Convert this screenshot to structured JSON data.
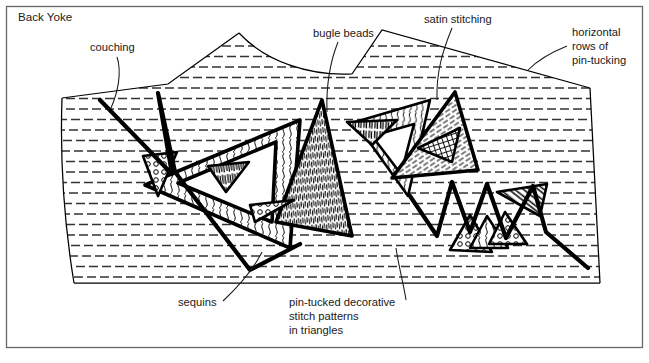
{
  "figure": {
    "title": "Back Yoke",
    "border_color": "#555555",
    "ink_color": "#000000",
    "tuck_color": "#2b2b2b",
    "background": "#ffffff"
  },
  "labels": [
    {
      "id": "back-yoke",
      "text": "Back Yoke",
      "lines": [
        "Back Yoke"
      ],
      "x": 18,
      "y": 21,
      "anchor": "start",
      "has_leader": false
    },
    {
      "id": "couching",
      "text": "couching",
      "lines": [
        "couching"
      ],
      "x": 90,
      "y": 51,
      "anchor": "start",
      "has_leader": true
    },
    {
      "id": "bugle-beads",
      "text": "bugle beads",
      "lines": [
        "bugle beads"
      ],
      "x": 313,
      "y": 37,
      "anchor": "start",
      "has_leader": true
    },
    {
      "id": "satin-stitching",
      "text": "satin stitching",
      "lines": [
        "satin stitching"
      ],
      "x": 424,
      "y": 23,
      "anchor": "start",
      "has_leader": true
    },
    {
      "id": "horizontal-rows-of-pin-tucking",
      "text": "horizontal rows of pin-tucking",
      "lines": [
        "horizontal",
        "rows of",
        "pin-tucking"
      ],
      "x": 572,
      "y": 36,
      "anchor": "start",
      "has_leader": true
    },
    {
      "id": "sequins",
      "text": "sequins",
      "lines": [
        "sequins"
      ],
      "x": 178,
      "y": 306,
      "anchor": "start",
      "has_leader": true
    },
    {
      "id": "pin-tucked-decorative-stitch-patterns-in-triangles",
      "text": "pin-tucked decorative stitch patterns in triangles",
      "lines": [
        "pin-tucked decorative",
        "stitch patterns",
        "in triangles"
      ],
      "x": 289,
      "y": 306,
      "anchor": "start",
      "has_leader": true
    }
  ],
  "leaders": [
    {
      "id": "leader-couching",
      "d": "M 117 57 C 122 72, 118 92, 111 108"
    },
    {
      "id": "leader-bugle-beads",
      "d": "M 338 42 C 330 62, 326 82, 327 112"
    },
    {
      "id": "leader-satin-stitching",
      "d": "M 452 28 C 443 50, 436 72, 437 100"
    },
    {
      "id": "leader-pin-tucking",
      "d": "M 567 46 C 552 52, 538 60, 528 70"
    },
    {
      "id": "leader-sequins",
      "d": "M 223 301 C 237 288, 252 272, 262 252"
    },
    {
      "id": "leader-stitch-patterns",
      "d": "M 406 300 C 404 286, 399 268, 396 248"
    }
  ],
  "yoke_outline": {
    "id": "yoke-panel",
    "d": "M 62 98 L 168 84 L 239 33 C 266 62, 310 76, 352 74 L 382 30 L 590 88 L 600 283 L 74 283 C 64 222, 60 156, 62 98 Z"
  },
  "garment_seams": [
    {
      "id": "shoulder-seam-left",
      "d": "M 62 98 L 168 84 L 239 33"
    },
    {
      "id": "neckline-curve",
      "d": "M 239 33 C 266 62, 310 76, 352 74"
    },
    {
      "id": "shoulder-seam-right",
      "d": "M 352 74 L 382 30 L 590 88"
    },
    {
      "id": "side-seam-right",
      "d": "M 590 88 L 600 283"
    },
    {
      "id": "hem-edge",
      "d": "M 600 283 L 74 283"
    },
    {
      "id": "side-seam-left",
      "d": "M 74 283 C 64 222, 60 156, 62 98"
    }
  ],
  "pin_tucking": {
    "name": "horizontal-rows-of-pin-tucking",
    "row_spacing_px": 10.5,
    "dash_pattern": "9 4",
    "stroke_width": 1.6,
    "rows": 24,
    "first_row_y": 46,
    "color": "#333333"
  },
  "decorative_elements": [
    {
      "id": "couching-line",
      "kind": "couching",
      "note": "heavy free-form couched cord running across the yoke"
    },
    {
      "id": "bugle-beads",
      "kind": "bugle-beads",
      "note": "short stroke clusters inside small triangles"
    },
    {
      "id": "satin-stitch",
      "kind": "satin-stitching",
      "note": "dense parallel fill in triangles"
    },
    {
      "id": "sequins",
      "kind": "sequins",
      "note": "small circles scattered in triangle wedges"
    },
    {
      "id": "triangle-stitch",
      "kind": "stitch-patterns",
      "note": "wavy, vertical, hatched machine-stitch fills"
    }
  ],
  "triangles": [
    {
      "id": "tri-big-left",
      "fill": "wavy",
      "points": "145,185 300,120 290,248"
    },
    {
      "id": "tri-big-left-in",
      "fill": "none",
      "points": "178,183 276,142 272,222"
    },
    {
      "id": "tri-vertical",
      "fill": "vertical",
      "points": "322,100 352,236 276,222"
    },
    {
      "id": "tri-wave-mid",
      "fill": "wavy2",
      "points": "355,122 430,100 408,196"
    },
    {
      "id": "tri-wave-mid-in",
      "fill": "none",
      "points": "372,136 414,124 401,174"
    },
    {
      "id": "tri-big-right",
      "fill": "diagonal",
      "points": "392,178 455,92 478,170"
    },
    {
      "id": "tri-right-inner",
      "fill": "grid",
      "points": "418,148 460,128 452,162"
    },
    {
      "id": "tri-bead-small",
      "fill": "bead",
      "points": "347,122 397,120 372,145"
    },
    {
      "id": "tri-seq-left",
      "fill": "sequin",
      "points": "143,156 177,152 158,196"
    },
    {
      "id": "tri-fan-left",
      "fill": "fan",
      "points": "208,166 249,162 226,192"
    },
    {
      "id": "tri-seq-mid",
      "fill": "sequin",
      "points": "250,205 294,200 255,222"
    },
    {
      "id": "tri-hatch-right",
      "fill": "hatch",
      "points": "497,192 547,184 540,216"
    },
    {
      "id": "tri-lr-a",
      "fill": "sequin",
      "points": "450,250 470,215 492,252"
    },
    {
      "id": "tri-lr-b",
      "fill": "wavy",
      "points": "470,248 487,216 508,248"
    },
    {
      "id": "tri-lr-c",
      "fill": "sequin",
      "points": "489,244 505,212 527,244"
    }
  ],
  "bold_paths": [
    {
      "id": "couch-path-left",
      "d": "M 100 100 L 172 174 L 158 93 L 175 172 L 250 270 L 300 244"
    },
    {
      "id": "zigzag-right",
      "d": "M 410 196 L 437 236 L 452 182 L 470 232 L 487 184 L 506 238 L 533 186 L 546 232 L 588 268"
    }
  ]
}
